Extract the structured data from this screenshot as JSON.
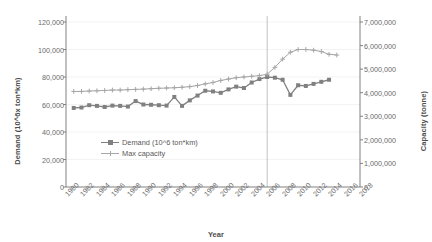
{
  "chart_data": {
    "type": "line",
    "title": "",
    "xlabel": "Year",
    "ylabel": "Demand (10^6x ton*km)",
    "y2label": "Capacity (tonne)",
    "xlim": [
      1980,
      2018
    ],
    "ylim": [
      0,
      120000
    ],
    "y2lim": [
      0,
      7000000
    ],
    "grid": true,
    "legend_position": "inside-center-left",
    "xticks": [
      "1980",
      "1982",
      "1984",
      "1986",
      "1988",
      "1990",
      "1992",
      "1994",
      "1996",
      "1998",
      "2000",
      "2002",
      "2004",
      "2006",
      "2008",
      "2010",
      "2012",
      "2014",
      "2016",
      "2018"
    ],
    "yticks": [
      "0",
      "20,000",
      "40,000",
      "60,000",
      "80,000",
      "100,000",
      "120,000"
    ],
    "y2ticks": [
      "0",
      "1,000,000",
      "2,000,000",
      "3,000,000",
      "4,000,000",
      "5,000,000",
      "6,000,000",
      "7,000,000"
    ],
    "annotations": [
      {
        "type": "vertical-line",
        "x": 2006,
        "label": ""
      }
    ],
    "series": [
      {
        "name": "Demand (10^6 ton*km)",
        "axis": "left",
        "color": "#808080",
        "marker": "square",
        "x": [
          1981,
          1982,
          1983,
          1984,
          1985,
          1986,
          1987,
          1988,
          1989,
          1990,
          1991,
          1992,
          1993,
          1994,
          1995,
          1996,
          1997,
          1998,
          1999,
          2000,
          2001,
          2002,
          2003,
          2004,
          2005,
          2006,
          2007,
          2008,
          2009,
          2010,
          2011,
          2012,
          2013,
          2014
        ],
        "values": [
          57500,
          57800,
          59500,
          59000,
          58200,
          59200,
          59000,
          58500,
          62500,
          60000,
          59800,
          59500,
          59200,
          65500,
          59000,
          63000,
          66500,
          70000,
          69500,
          68500,
          71000,
          73000,
          72000,
          76000,
          78500,
          80000,
          79500,
          78000,
          67000,
          74000,
          73500,
          75000,
          76500,
          78000
        ]
      },
      {
        "name": "Max capacity",
        "axis": "left",
        "color": "#a6a6a6",
        "marker": "plus",
        "x": [
          1981,
          1982,
          1983,
          1984,
          1985,
          1986,
          1987,
          1988,
          1989,
          1990,
          1991,
          1992,
          1993,
          1994,
          1995,
          1996,
          1997,
          1998,
          1999,
          2000,
          2001,
          2002,
          2003,
          2004,
          2005,
          2006,
          2007,
          2008,
          2009,
          2010,
          2011,
          2012,
          2013,
          2014,
          2015
        ],
        "values": [
          69500,
          69500,
          69800,
          70000,
          70200,
          70500,
          70500,
          70800,
          71000,
          71200,
          71500,
          71800,
          72000,
          72200,
          72500,
          73000,
          73800,
          75000,
          76000,
          77500,
          78500,
          79500,
          80000,
          80500,
          81000,
          82000,
          87000,
          93000,
          98000,
          100000,
          100000,
          99500,
          98500,
          96500,
          96000
        ]
      }
    ]
  }
}
